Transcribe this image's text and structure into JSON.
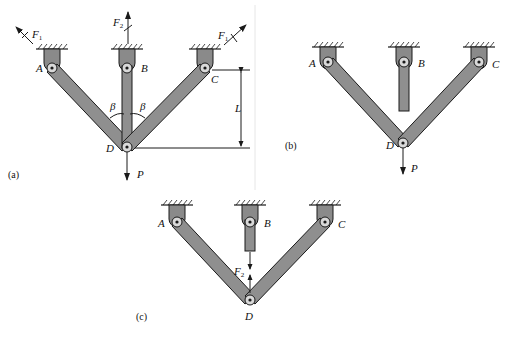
{
  "figures": {
    "a": {
      "caption": "(a)",
      "labels": {
        "A": "A",
        "B": "B",
        "C": "C",
        "D": "D",
        "P": "P",
        "L": "L",
        "beta_left": "β",
        "beta_right": "β"
      },
      "forces": {
        "F1_left": {
          "symbol": "F",
          "subscript": "1"
        },
        "F2": {
          "symbol": "F",
          "subscript": "2"
        },
        "F1_right": {
          "symbol": "F",
          "subscript": "1"
        }
      },
      "description": "Three-bar truss with bars AD, BD, CD pinned at D; load P applied downward at D; angle β between vertical bar BD and each inclined bar; vertical height L from C to D."
    },
    "b": {
      "caption": "(b)",
      "labels": {
        "A": "A",
        "B": "B",
        "C": "C",
        "D": "D",
        "P": "P"
      },
      "description": "Released structure: bar BD disconnected at D; load P applied at D."
    },
    "c": {
      "caption": "(c)",
      "labels": {
        "A": "A",
        "B": "B",
        "C": "C",
        "D": "D"
      },
      "forces": {
        "F2": {
          "symbol": "F",
          "subscript": "2"
        }
      },
      "description": "Redundant force F2 applied as equal and opposite forces on bar B end and at joint D."
    }
  },
  "colors": {
    "bar_fill": "#8f8f8f",
    "outline": "#1a1a1a",
    "background": "#ffffff"
  }
}
